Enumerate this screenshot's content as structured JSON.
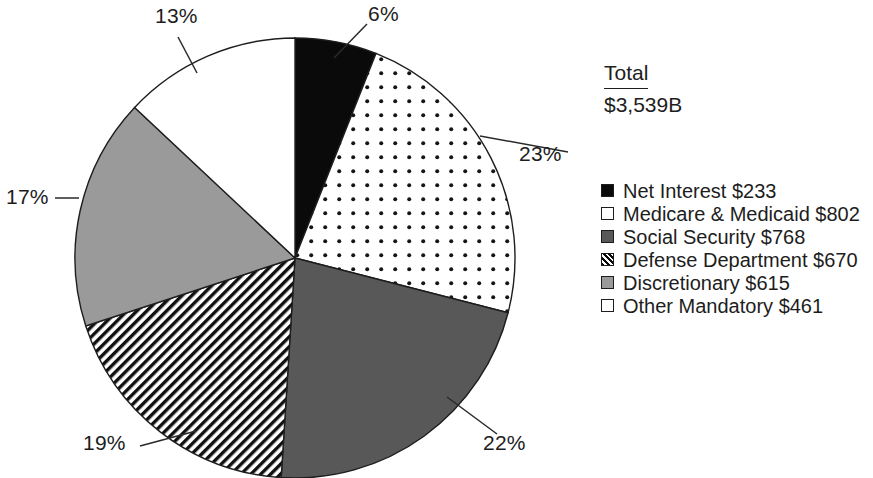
{
  "chart_data": {
    "type": "pie",
    "title": "",
    "total_label": "Total",
    "total_value": "$3,539B",
    "categories": [
      "Net Interest",
      "Medicare & Medicaid",
      "Social Security",
      "Defense Department",
      "Discretionary",
      "Other Mandatory"
    ],
    "values": [
      233,
      802,
      768,
      670,
      615,
      461
    ],
    "value_unit": "billions of dollars",
    "percent_labels": [
      "6%",
      "23%",
      "22%",
      "19%",
      "17%",
      "13%"
    ],
    "percentages": [
      6,
      23,
      22,
      19,
      17,
      13
    ],
    "slice_fills": [
      "solid-black",
      "white-dotted",
      "dark-gray",
      "diagonal-hatch",
      "light-gray",
      "white"
    ],
    "colors": {
      "net_interest": "#0a0a0a",
      "medicare_medicaid": "#ffffff",
      "social_security": "#585858",
      "defense_department": "#ffffff",
      "discretionary": "#9a9a9a",
      "other_mandatory": "#ffffff",
      "outline": "#1d1d1d",
      "text": "#1d1d1d",
      "background": "#ffffff"
    },
    "start_angle_deg": 0,
    "direction": "clockwise",
    "legend_position": "right",
    "grid": false,
    "labels_have_leader_lines": true
  },
  "legend": {
    "items": [
      {
        "label": "Net Interest $233",
        "swatch": "solid-black-square-icon"
      },
      {
        "label": "Medicare & Medicaid $802",
        "swatch": "white-square-icon"
      },
      {
        "label": "Social Security $768",
        "swatch": "dark-gray-square-icon"
      },
      {
        "label": "Defense Department $670",
        "swatch": "hatched-square-icon"
      },
      {
        "label": "Discretionary $615",
        "swatch": "light-gray-square-icon"
      },
      {
        "label": "Other Mandatory $461",
        "swatch": "white-square-icon"
      }
    ]
  },
  "pie_labels": [
    {
      "name": "net-interest",
      "text": "6%",
      "x": 368,
      "y": 4
    },
    {
      "name": "medicare-medicaid",
      "text": "23%",
      "x": 519,
      "y": 144
    },
    {
      "name": "social-security",
      "text": "22%",
      "x": 483,
      "y": 433
    },
    {
      "name": "defense-department",
      "text": "19%",
      "x": 83,
      "y": 433
    },
    {
      "name": "discretionary",
      "text": "17%",
      "x": 6,
      "y": 185
    },
    {
      "name": "other-mandatory",
      "text": "13%",
      "x": 155,
      "y": 6
    }
  ]
}
